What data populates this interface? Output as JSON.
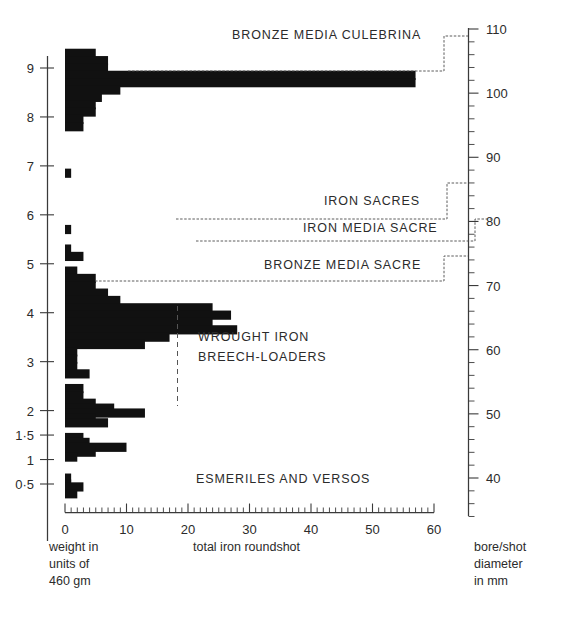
{
  "figure": {
    "title": "",
    "background": "#ffffff",
    "bar_color": "#111111",
    "axis_color": "#3a3a3a"
  },
  "left_axis": {
    "label_lines": [
      "weight in",
      "units of",
      "460 gm"
    ],
    "ticks": [
      "9",
      "8",
      "7",
      "6",
      "5",
      "4",
      "3",
      "2",
      "1·5",
      "1",
      "0·5"
    ]
  },
  "bottom_axis": {
    "label": "total iron roundshot",
    "ticks": [
      "0",
      "10",
      "20",
      "30",
      "40",
      "50",
      "60"
    ]
  },
  "right_axis": {
    "label_lines": [
      "bore/shot",
      "diameter",
      "in mm"
    ],
    "ticks": [
      "110",
      "100",
      "90",
      "80",
      "70",
      "60",
      "50",
      "40"
    ]
  },
  "categories": [
    {
      "name": "bronze-media-culebrina",
      "label": "BRONZE MEDIA CULEBRINA"
    },
    {
      "name": "iron-sacres",
      "label": "IRON SACRES"
    },
    {
      "name": "iron-media-sacre",
      "label": "IRON MEDIA SACRE"
    },
    {
      "name": "bronze-media-sacre",
      "label": "BRONZE MEDIA SACRE"
    },
    {
      "name": "wrought-iron-breech-loaders",
      "label": "WROUGHT IRON"
    },
    {
      "name": "wrought-iron-breech-loaders-2",
      "label": "BREECH-LOADERS"
    },
    {
      "name": "esmeriles-and-versos",
      "label": "ESMERILES AND VERSOS"
    }
  ],
  "chart_data": {
    "type": "bar",
    "orientation": "horizontal",
    "title": "",
    "xlabel": "total iron roundshot",
    "ylabel": "weight in units of 460 gm",
    "y2label": "bore/shot diameter in mm",
    "xlim": [
      0,
      60
    ],
    "ylim": [
      0.15,
      9.45
    ],
    "y2lim": [
      33.5,
      110.5
    ],
    "xticks": [
      0,
      10,
      20,
      30,
      40,
      50,
      60
    ],
    "xminor_step": 1,
    "yticks": [
      9,
      8,
      7,
      6,
      5,
      4,
      3,
      2,
      1.5,
      1,
      0.5
    ],
    "y2ticks": [
      110,
      100,
      90,
      80,
      70,
      60,
      50,
      40
    ],
    "y2minor_step": 2,
    "grid": false,
    "legend": false,
    "bins": [
      {
        "y": 9.3,
        "value": 5
      },
      {
        "y": 9.15,
        "value": 7
      },
      {
        "y": 9.0,
        "value": 7
      },
      {
        "y": 8.85,
        "value": 57
      },
      {
        "y": 8.7,
        "value": 57
      },
      {
        "y": 8.55,
        "value": 9
      },
      {
        "y": 8.4,
        "value": 6
      },
      {
        "y": 8.25,
        "value": 5
      },
      {
        "y": 8.1,
        "value": 5
      },
      {
        "y": 7.95,
        "value": 3
      },
      {
        "y": 7.8,
        "value": 3
      },
      {
        "y": 6.85,
        "value": 1
      },
      {
        "y": 5.7,
        "value": 1
      },
      {
        "y": 5.3,
        "value": 1
      },
      {
        "y": 5.15,
        "value": 3
      },
      {
        "y": 4.85,
        "value": 2
      },
      {
        "y": 4.7,
        "value": 5
      },
      {
        "y": 4.55,
        "value": 5
      },
      {
        "y": 4.4,
        "value": 7
      },
      {
        "y": 4.25,
        "value": 9
      },
      {
        "y": 4.1,
        "value": 24
      },
      {
        "y": 3.95,
        "value": 27
      },
      {
        "y": 3.8,
        "value": 24
      },
      {
        "y": 3.65,
        "value": 28
      },
      {
        "y": 3.5,
        "value": 17
      },
      {
        "y": 3.35,
        "value": 13
      },
      {
        "y": 3.2,
        "value": 2
      },
      {
        "y": 3.05,
        "value": 2
      },
      {
        "y": 2.9,
        "value": 2
      },
      {
        "y": 2.75,
        "value": 4
      },
      {
        "y": 2.45,
        "value": 3
      },
      {
        "y": 2.3,
        "value": 3
      },
      {
        "y": 2.15,
        "value": 5
      },
      {
        "y": 2.05,
        "value": 8
      },
      {
        "y": 1.95,
        "value": 13
      },
      {
        "y": 1.85,
        "value": 5
      },
      {
        "y": 1.75,
        "value": 7
      },
      {
        "y": 1.45,
        "value": 3
      },
      {
        "y": 1.35,
        "value": 4
      },
      {
        "y": 1.25,
        "value": 10
      },
      {
        "y": 1.15,
        "value": 5
      },
      {
        "y": 1.05,
        "value": 2
      },
      {
        "y": 0.62,
        "value": 1
      },
      {
        "y": 0.5,
        "value": 1
      },
      {
        "y": 0.44,
        "value": 3
      },
      {
        "y": 0.3,
        "value": 2
      }
    ]
  }
}
